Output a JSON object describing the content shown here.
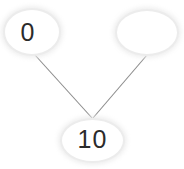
{
  "diagram": {
    "type": "number-bond",
    "background_color": "#ffffff",
    "node_border_color": "#ececec",
    "edge_color": "#8c8c8c",
    "text_color": "#2b2b2b",
    "nodes": [
      {
        "id": "part-left",
        "label": "0",
        "role": "part",
        "empty": false
      },
      {
        "id": "part-right",
        "label": "",
        "role": "part",
        "empty": true
      },
      {
        "id": "whole",
        "label": "10",
        "role": "whole",
        "empty": false
      }
    ],
    "edges": [
      {
        "from": "part-left",
        "to": "whole"
      },
      {
        "from": "part-right",
        "to": "whole"
      }
    ]
  }
}
